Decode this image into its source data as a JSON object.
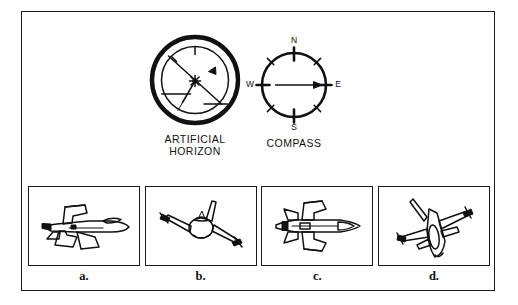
{
  "figure": {
    "background_color": "#ffffff",
    "ink_color": "#111111",
    "frame": {
      "border_color": "#1a1a1a"
    }
  },
  "instruments": [
    {
      "id": "artificial-horizon",
      "caption_line1": "ARTIFICIAL",
      "caption_line2": "HORIZON",
      "type": "attitude-indicator",
      "reading": {
        "bank_angle_deg": -45,
        "pitch": "level",
        "description": "Horizon bar tilted, indicating a left bank of approximately 45 degrees",
        "index_pointer_position": "upper-right",
        "center_marker": "star"
      }
    },
    {
      "id": "compass",
      "caption_line1": "COMPASS",
      "caption_line2": "",
      "type": "heading-indicator",
      "cardinal_labels": {
        "north": "N",
        "east": "E",
        "south": "S",
        "west": "W"
      },
      "reading": {
        "heading": "E",
        "heading_deg": 90,
        "needle_direction": "east",
        "description": "Needle points east, indicating a heading of 090 degrees"
      },
      "tick_count": 8
    }
  ],
  "options": [
    {
      "label": "a.",
      "name": "option-a",
      "view": "side-profile",
      "description": "Aircraft in level side view flying to the right, wings horizontal"
    },
    {
      "label": "b.",
      "name": "option-b",
      "view": "front-oblique",
      "description": "Aircraft viewed nose-on with wings banked steeply, nose raised"
    },
    {
      "label": "c.",
      "name": "option-c",
      "view": "top-plan",
      "description": "Aircraft viewed from directly above, wings level, flying right"
    },
    {
      "label": "d.",
      "name": "option-d",
      "view": "three-quarter-banked",
      "description": "Aircraft in banked three-quarter view, nose pitched and rolled"
    }
  ]
}
